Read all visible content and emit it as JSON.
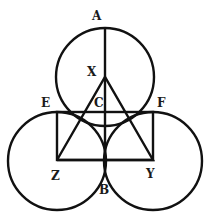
{
  "diagram": {
    "type": "geometry",
    "colors": {
      "stroke": "#111111",
      "background": "#ffffff"
    },
    "circles": [
      {
        "name": "top",
        "cx": 105,
        "cy": 77,
        "r": 49
      },
      {
        "name": "left",
        "cx": 57,
        "cy": 161,
        "r": 49
      },
      {
        "name": "right",
        "cx": 153,
        "cy": 161,
        "r": 49
      }
    ],
    "labels": {
      "A": "A",
      "X": "X",
      "C": "C",
      "E": "E",
      "F": "F",
      "Z": "Z",
      "Y": "Y",
      "B": "B"
    }
  }
}
